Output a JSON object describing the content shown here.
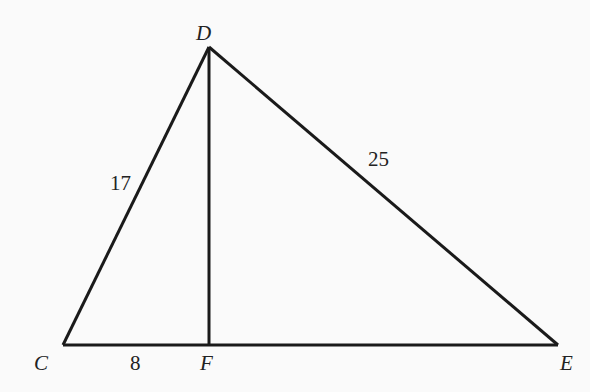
{
  "diagram": {
    "type": "geometry-triangle",
    "vertices": {
      "D": {
        "label": "D",
        "x": 209,
        "y": 47
      },
      "C": {
        "label": "C",
        "x": 63,
        "y": 345
      },
      "F": {
        "label": "F",
        "x": 209,
        "y": 345
      },
      "E": {
        "label": "E",
        "x": 558,
        "y": 345
      }
    },
    "segments": [
      {
        "from": "C",
        "to": "D",
        "length_label": "17"
      },
      {
        "from": "D",
        "to": "E",
        "length_label": "25"
      },
      {
        "from": "C",
        "to": "F",
        "length_label": "8"
      },
      {
        "from": "F",
        "to": "E",
        "length_label": ""
      },
      {
        "from": "D",
        "to": "F",
        "length_label": ""
      }
    ],
    "labels": {
      "D": "D",
      "C": "C",
      "F": "F",
      "E": "E",
      "cd": "17",
      "de": "25",
      "cf": "8"
    },
    "line_color": "#1a1a1a"
  }
}
